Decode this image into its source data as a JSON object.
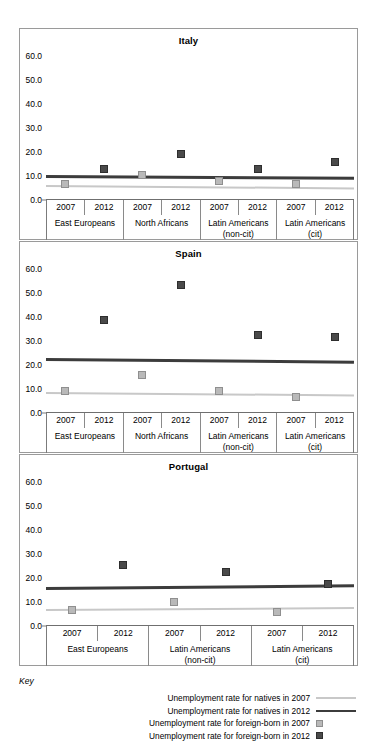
{
  "key": {
    "label": "Key",
    "entries": [
      {
        "text": "Unemployment rate for natives in 2007",
        "symbol": "line-light"
      },
      {
        "text": "Unemployment rate for natives in 2012",
        "symbol": "line-dark"
      },
      {
        "text": "Unemployment rate for foreign-born in 2007",
        "symbol": "square-light"
      },
      {
        "text": "Unemployment rate for foreign-born in 2012",
        "symbol": "square-dark"
      }
    ]
  },
  "colors": {
    "natives_2007": "#c8c8c8",
    "natives_2012": "#3c3c3c",
    "foreign_2007": "#b9b9b9",
    "foreign_2012": "#4a4a4a",
    "axis": "#7b7b7b",
    "panel_border": "#9a9a9a"
  },
  "axis": {
    "yticks": [
      "0.0",
      "10.0",
      "20.0",
      "30.0",
      "40.0",
      "50.0",
      "60.0"
    ],
    "ylim": [
      0,
      60
    ],
    "year_2007": "2007",
    "year_2012": "2012"
  },
  "chart_data": [
    {
      "type": "scatter",
      "title": "Italy",
      "xlabel": "",
      "ylabel": "",
      "ylim": [
        0,
        60
      ],
      "yticks": [
        0,
        10,
        20,
        30,
        40,
        50,
        60
      ],
      "grid": false,
      "legend_position": "below-figure",
      "categories": [
        {
          "group": "East Europeans",
          "group_line2": "",
          "years": [
            "2007",
            "2012"
          ]
        },
        {
          "group": "North Africans",
          "group_line2": "",
          "years": [
            "2007",
            "2012"
          ]
        },
        {
          "group": "Latin Americans",
          "group_line2": "(non-cit)",
          "years": [
            "2007",
            "2012"
          ]
        },
        {
          "group": "Latin Americans",
          "group_line2": "(cit)",
          "years": [
            "2007",
            "2012"
          ]
        }
      ],
      "series": [
        {
          "name": "Unemployment rate for foreign-born in 2007",
          "style": "square-light",
          "values": [
            6.8,
            null,
            10.4,
            null,
            8.0,
            null,
            6.7,
            null
          ]
        },
        {
          "name": "Unemployment rate for foreign-born in 2012",
          "style": "square-dark",
          "values": [
            null,
            12.9,
            null,
            19.2,
            null,
            13.1,
            null,
            15.9
          ]
        },
        {
          "name": "Unemployment rate for natives in 2007",
          "style": "line-light",
          "line": {
            "start": 6.3,
            "end": 5.3
          }
        },
        {
          "name": "Unemployment rate for natives in 2012",
          "style": "line-dark",
          "line": {
            "start": 10.3,
            "end": 9.6
          }
        }
      ]
    },
    {
      "type": "scatter",
      "title": "Spain",
      "xlabel": "",
      "ylabel": "",
      "ylim": [
        0,
        60
      ],
      "yticks": [
        0,
        10,
        20,
        30,
        40,
        50,
        60
      ],
      "grid": false,
      "legend_position": "below-figure",
      "categories": [
        {
          "group": "East Europeans",
          "group_line2": "",
          "years": [
            "2007",
            "2012"
          ]
        },
        {
          "group": "North Africans",
          "group_line2": "",
          "years": [
            "2007",
            "2012"
          ]
        },
        {
          "group": "Latin Americans",
          "group_line2": "(non-cit)",
          "years": [
            "2007",
            "2012"
          ]
        },
        {
          "group": "Latin Americans",
          "group_line2": "(cit)",
          "years": [
            "2007",
            "2012"
          ]
        }
      ],
      "series": [
        {
          "name": "Unemployment rate for foreign-born in 2007",
          "style": "square-light",
          "values": [
            9.3,
            null,
            15.9,
            null,
            9.2,
            null,
            6.7,
            null
          ]
        },
        {
          "name": "Unemployment rate for foreign-born in 2012",
          "style": "square-dark",
          "values": [
            null,
            38.6,
            null,
            53.5,
            null,
            32.5,
            null,
            31.7
          ]
        },
        {
          "name": "Unemployment rate for natives in 2007",
          "style": "line-light",
          "line": {
            "start": 8.6,
            "end": 7.6
          }
        },
        {
          "name": "Unemployment rate for natives in 2012",
          "style": "line-dark",
          "line": {
            "start": 23.0,
            "end": 21.9
          }
        }
      ]
    },
    {
      "type": "scatter",
      "title": "Portugal",
      "xlabel": "",
      "ylabel": "",
      "ylim": [
        0,
        60
      ],
      "yticks": [
        0,
        10,
        20,
        30,
        40,
        50,
        60
      ],
      "grid": false,
      "legend_position": "below-figure",
      "categories": [
        {
          "group": "East Europeans",
          "group_line2": "",
          "years": [
            "2007",
            "2012"
          ]
        },
        {
          "group": "Latin Americans",
          "group_line2": "(non-cit)",
          "years": [
            "2007",
            "2012"
          ]
        },
        {
          "group": "Latin Americans",
          "group_line2": "(cit)",
          "years": [
            "2007",
            "2012"
          ]
        }
      ],
      "series": [
        {
          "name": "Unemployment rate for foreign-born in 2007",
          "style": "square-light",
          "values": [
            6.8,
            null,
            9.9,
            null,
            5.8,
            null
          ]
        },
        {
          "name": "Unemployment rate for foreign-born in 2012",
          "style": "square-dark",
          "values": [
            null,
            25.5,
            null,
            22.5,
            null,
            17.3
          ]
        },
        {
          "name": "Unemployment rate for natives in 2007",
          "style": "line-light",
          "line": {
            "start": 7.2,
            "end": 8.0
          }
        },
        {
          "name": "Unemployment rate for natives in 2012",
          "style": "line-dark",
          "line": {
            "start": 16.3,
            "end": 17.4
          }
        }
      ]
    }
  ]
}
